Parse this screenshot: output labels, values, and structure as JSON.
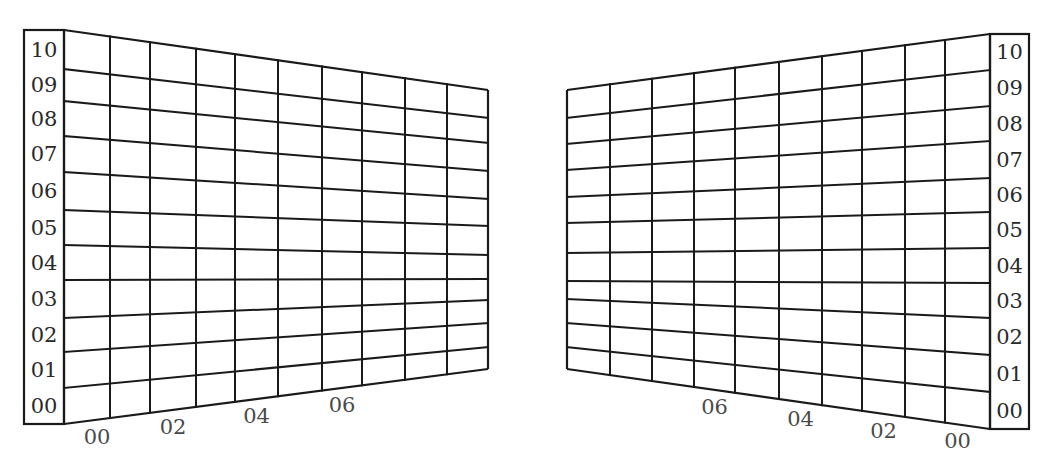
{
  "diagram": {
    "stroke_color": "#1a1a1a",
    "label_color": "#2a2a2a",
    "background": "#ffffff",
    "left_panel": {
      "row_labels": [
        "10",
        "09",
        "08",
        "07",
        "06",
        "05",
        "04",
        "03",
        "02",
        "01",
        "00"
      ],
      "column_labels": [
        "00",
        "02",
        "04",
        "06"
      ],
      "columns": 10,
      "rows": 11
    },
    "right_panel": {
      "row_labels": [
        "10",
        "09",
        "08",
        "07",
        "06",
        "05",
        "04",
        "03",
        "02",
        "01",
        "00"
      ],
      "column_labels": [
        "06",
        "04",
        "02",
        "00"
      ],
      "columns": 10,
      "rows": 11
    }
  }
}
